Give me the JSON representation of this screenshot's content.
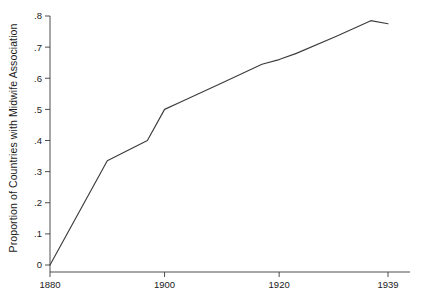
{
  "chart_data": {
    "type": "line",
    "title": "",
    "xlabel": "",
    "ylabel": "Proportion of Countries with Midwife Association",
    "xlim": [
      1880,
      1939
    ],
    "ylim": [
      0,
      0.8
    ],
    "grid": false,
    "legend": "none",
    "line_color": "#3c3c3c",
    "x_ticks": [
      1880,
      1900,
      1920,
      1939
    ],
    "x_tick_labels": [
      "1880",
      "1900",
      "1920",
      "1939"
    ],
    "y_ticks": [
      0,
      0.1,
      0.2,
      0.3,
      0.4,
      0.5,
      0.6,
      0.7,
      0.8
    ],
    "y_tick_labels": [
      "0",
      ".1",
      ".2",
      ".3",
      ".4",
      ".5",
      ".6",
      ".7",
      ".8"
    ],
    "series": [
      {
        "name": "Proportion of Countries with Midwife Association",
        "x": [
          1880,
          1890,
          1897,
          1900,
          1903,
          1910,
          1917,
          1920,
          1923,
          1930,
          1936,
          1939
        ],
        "values": [
          0.0,
          0.335,
          0.4,
          0.5,
          0.525,
          0.585,
          0.645,
          0.66,
          0.68,
          0.735,
          0.785,
          0.775
        ]
      }
    ]
  },
  "axis": {
    "y_label_text": "Proportion of Countries with Midwife Association"
  }
}
